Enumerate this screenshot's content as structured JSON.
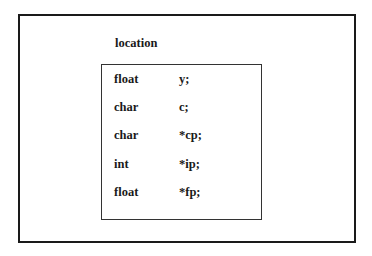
{
  "diagram": {
    "outer_label": "location",
    "fields": [
      {
        "type": "float",
        "name": "y;"
      },
      {
        "type": "char",
        "name": "c;"
      },
      {
        "type": "char",
        "name": "*cp;"
      },
      {
        "type": "int",
        "name": "*ip;"
      },
      {
        "type": "float",
        "name": "*fp;"
      }
    ]
  }
}
